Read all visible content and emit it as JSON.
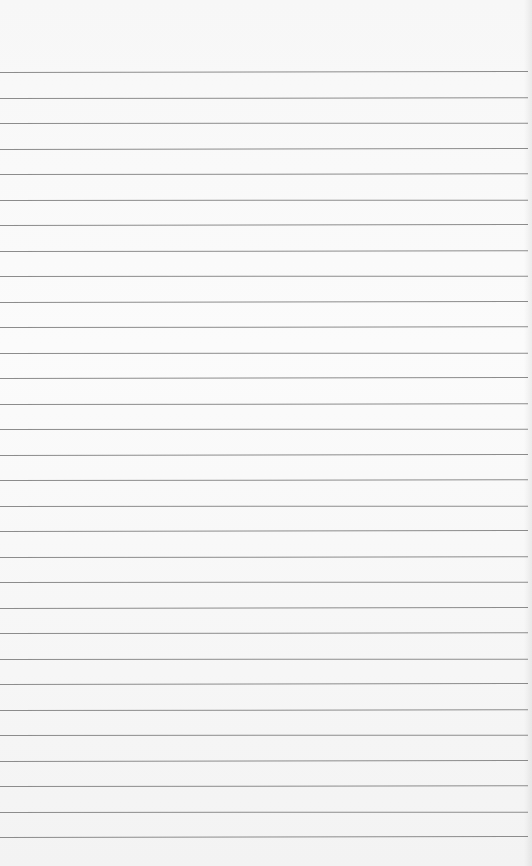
{
  "paper": {
    "type": "blank ruled notebook paper",
    "background_color": "#f8f8f8",
    "line_color": "#8c8c8c",
    "first_line_y": 72,
    "line_spacing": 25.5,
    "line_count": 31
  }
}
